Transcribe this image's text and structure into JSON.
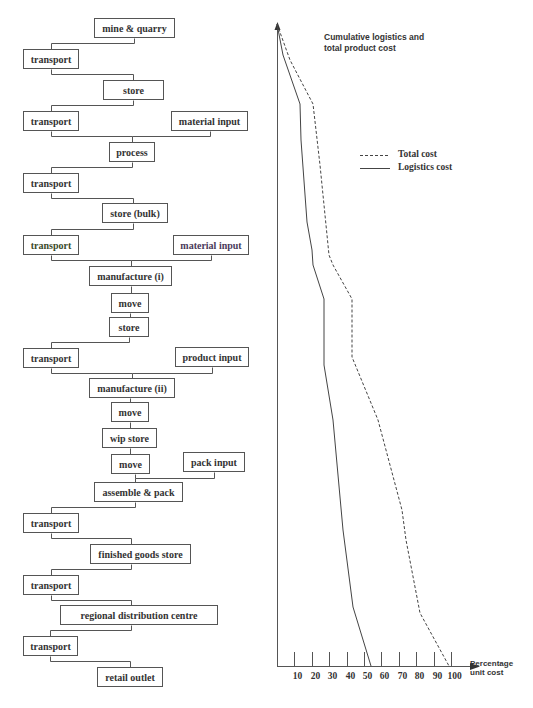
{
  "diagram": {
    "nodes": [
      {
        "id": "n1",
        "label": "mine & quarry",
        "x": 94,
        "y": 18,
        "w": 81,
        "h": 20
      },
      {
        "id": "n2",
        "label": "transport",
        "x": 23,
        "y": 49,
        "w": 56,
        "h": 20
      },
      {
        "id": "n3",
        "label": "store",
        "x": 103,
        "y": 80,
        "w": 61,
        "h": 20
      },
      {
        "id": "n4",
        "label": "transport",
        "x": 23,
        "y": 111,
        "w": 56,
        "h": 20
      },
      {
        "id": "n5",
        "label": "material input",
        "x": 171,
        "y": 111,
        "w": 77,
        "h": 20
      },
      {
        "id": "n6",
        "label": "process",
        "x": 109,
        "y": 142,
        "w": 46,
        "h": 20
      },
      {
        "id": "n7",
        "label": "transport",
        "x": 23,
        "y": 173,
        "w": 56,
        "h": 20
      },
      {
        "id": "n8",
        "label": "store (bulk)",
        "x": 102,
        "y": 203,
        "w": 66,
        "h": 20
      },
      {
        "id": "n9",
        "label": "transport",
        "x": 23,
        "y": 235,
        "w": 56,
        "h": 20,
        "color": "#3a4a2a"
      },
      {
        "id": "n10",
        "label": "material input",
        "x": 173,
        "y": 235,
        "w": 76,
        "h": 20,
        "color": "#4a3a5a"
      },
      {
        "id": "n11",
        "label": "manufacture (i)",
        "x": 89,
        "y": 266,
        "w": 83,
        "h": 20
      },
      {
        "id": "n12",
        "label": "move",
        "x": 111,
        "y": 293,
        "w": 38,
        "h": 20
      },
      {
        "id": "n13",
        "label": "store",
        "x": 109,
        "y": 317,
        "w": 40,
        "h": 20
      },
      {
        "id": "n14",
        "label": "transport",
        "x": 23,
        "y": 348,
        "w": 56,
        "h": 20
      },
      {
        "id": "n15",
        "label": "product input",
        "x": 175,
        "y": 347,
        "w": 74,
        "h": 20
      },
      {
        "id": "n16",
        "label": "manufacture (ii)",
        "x": 89,
        "y": 378,
        "w": 86,
        "h": 20
      },
      {
        "id": "n17",
        "label": "move",
        "x": 111,
        "y": 402,
        "w": 38,
        "h": 20
      },
      {
        "id": "n18",
        "label": "wip store",
        "x": 102,
        "y": 428,
        "w": 55,
        "h": 20
      },
      {
        "id": "n19",
        "label": "move",
        "x": 111,
        "y": 454,
        "w": 39,
        "h": 20
      },
      {
        "id": "n20",
        "label": "pack input",
        "x": 183,
        "y": 452,
        "w": 62,
        "h": 20
      },
      {
        "id": "n21",
        "label": "assemble & pack",
        "x": 94,
        "y": 482,
        "w": 89,
        "h": 20
      },
      {
        "id": "n22",
        "label": "transport",
        "x": 23,
        "y": 513,
        "w": 56,
        "h": 20
      },
      {
        "id": "n23",
        "label": "finished goods store",
        "x": 90,
        "y": 544,
        "w": 101,
        "h": 20
      },
      {
        "id": "n24",
        "label": "transport",
        "x": 23,
        "y": 575,
        "w": 56,
        "h": 20
      },
      {
        "id": "n25",
        "label": "regional distribution centre",
        "x": 60,
        "y": 605,
        "w": 158,
        "h": 20
      },
      {
        "id": "n26",
        "label": "transport",
        "x": 23,
        "y": 636,
        "w": 55,
        "h": 20
      },
      {
        "id": "n27",
        "label": "retail outlet",
        "x": 97,
        "y": 667,
        "w": 66,
        "h": 20
      }
    ],
    "connectors": [
      "M134,38 V43 H51 V49",
      "M51,69 V74 H133 V80",
      "M133,100 V105 H51 V111",
      "M51,131 V136 H132 M210,131 V136 H132 V142",
      "M132,162 V167 H51 V173",
      "M51,193 V198 H133 V203",
      "M133,223 V229 H51 V235",
      "M51,255 V260 H131 M211,255 V260 H131 V266",
      "M131,286 V293",
      "M130,313 V317",
      "M129,337 V342 H51 V348",
      "M51,368 V373 H132 M212,367 V373 H132 V378",
      "M130,398 V402",
      "M130,422 V428",
      "M130,448 V454",
      "M135,474 V478 H214 V472 M135,478 V482",
      "M135,502 V507 H51 V513",
      "M51,533 V538 H131 V544",
      "M131,564 V569 H51 V575",
      "M51,595 V600 H131 V605",
      "M131,625 V630 H50 V636",
      "M50,656 V661 H130 V667"
    ]
  },
  "chart_data": {
    "type": "line",
    "title": "Cumulative logistics and total product cost",
    "xlabel": "Percentage unit cost",
    "ylabel": "",
    "xlim": [
      0,
      100
    ],
    "x_ticks": [
      10,
      20,
      30,
      40,
      50,
      60,
      70,
      80,
      90,
      100
    ],
    "orientation": "cumulative cost (x) plotted down the supply-chain stages (y, top to bottom)",
    "grid": false,
    "legend_position": "upper right",
    "series": [
      {
        "name": "Total cost",
        "style": "dashed",
        "points_px": [
          [
            277,
            24
          ],
          [
            290,
            60
          ],
          [
            313,
            104
          ],
          [
            320,
            165
          ],
          [
            329,
            255
          ],
          [
            333,
            265
          ],
          [
            352,
            299
          ],
          [
            352,
            357
          ],
          [
            378,
            420
          ],
          [
            402,
            510
          ],
          [
            406,
            540
          ],
          [
            420,
            613
          ],
          [
            449,
            666
          ]
        ],
        "final_value": 100
      },
      {
        "name": "Logistics cost",
        "style": "solid",
        "points_px": [
          [
            277,
            24
          ],
          [
            283,
            55
          ],
          [
            300,
            104
          ],
          [
            301,
            140
          ],
          [
            307,
            222
          ],
          [
            312,
            250
          ],
          [
            313,
            265
          ],
          [
            324,
            299
          ],
          [
            324,
            365
          ],
          [
            333,
            420
          ],
          [
            343,
            530
          ],
          [
            353,
            607
          ],
          [
            371,
            666
          ]
        ],
        "final_value": 53
      }
    ]
  },
  "chart": {
    "title_line1": "Cumulative logistics and",
    "title_line2": "total product cost",
    "legend": [
      {
        "label": "Total cost",
        "style": "dashed"
      },
      {
        "label": "Logistics cost",
        "style": "solid"
      }
    ],
    "axis_title_line1": "Percentage",
    "axis_title_line2": "unit cost",
    "tick_labels": [
      "10",
      "20",
      "30",
      "40",
      "50",
      "60",
      "70",
      "80",
      "90",
      "100"
    ],
    "colors": {
      "line": "#444444",
      "axis": "#555555",
      "text": "#333333"
    }
  }
}
